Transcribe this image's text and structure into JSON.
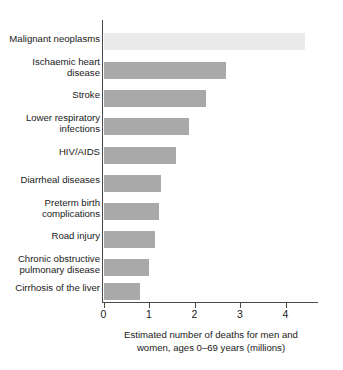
{
  "chart_data": {
    "type": "bar",
    "orientation": "horizontal",
    "title": "",
    "subtitle": "",
    "xlabel": "Estimated number of deaths for men and women, ages 0–69 years (millions)",
    "xlabel_line1": "Estimated number of deaths for men and",
    "xlabel_line2": "women, ages 0–69 years (millions)",
    "ylabel": "",
    "xlim": [
      0,
      4.75
    ],
    "xticks": [
      0,
      1,
      2,
      3,
      4
    ],
    "xtick_labels": [
      "0",
      "1",
      "2",
      "3",
      "4"
    ],
    "grid": false,
    "legend": false,
    "categories": [
      "Malignant neoplasms",
      "Ischaemic heart disease",
      "Stroke",
      "Lower respiratory infections",
      "HIV/AIDS",
      "Diarrheal diseases",
      "Preterm birth complications",
      "Road injury",
      "Chronic obstructive pulmonary disease",
      "Cirrhosis of the liver"
    ],
    "category_labels": [
      "Malignant neoplasms",
      "Ischaemic heart\ndisease",
      "Stroke",
      "Lower respiratory\ninfections",
      "HIV/AIDS",
      "Diarrheal diseases",
      "Preterm birth\ncomplications",
      "Road injury",
      "Chronic obstructive\npulmonary disease",
      "Cirrhosis of the liver"
    ],
    "values": [
      4.42,
      2.7,
      2.26,
      1.87,
      1.6,
      1.27,
      1.21,
      1.14,
      0.99,
      0.81
    ],
    "bar_colors": [
      "#eaeaea",
      "#a9a9a9",
      "#a9a9a9",
      "#a9a9a9",
      "#a9a9a9",
      "#a9a9a9",
      "#a9a9a9",
      "#a9a9a9",
      "#a9a9a9",
      "#a9a9a9"
    ],
    "axis_color": "#4a4a4a",
    "text_color": "#1a1a1a",
    "background_color": "#ffffff"
  }
}
